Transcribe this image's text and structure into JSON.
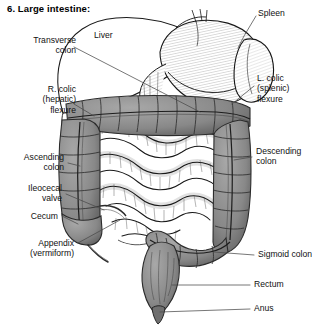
{
  "figure": {
    "title": "6. Large intestine:",
    "domain_note": "anatomical line drawing of abdominal viscera"
  },
  "labels": {
    "transverse_colon": "Transverse\ncolon",
    "liver": "Liver",
    "spleen": "Spleen",
    "r_colic_flexure": "R. colic\n(hepatic)\nflexure",
    "l_colic_flexure": "L. colic\n(splenic)\nflexure",
    "ascending_colon": "Ascending\ncolon",
    "descending_colon": "Descending\ncolon",
    "ileocecal_valve": "Ileocecal\nvalve",
    "cecum": "Cecum",
    "appendix": "Appendix\n(vermiform)",
    "sigmoid_colon": "Sigmoid colon",
    "rectum": "Rectum",
    "anus": "Anus"
  },
  "colors": {
    "ink": "#111111",
    "colon_fill": "#8d8d8d",
    "colon_dark": "#6e6e6e",
    "organ_fill": "#ffffff",
    "leader": "#555555",
    "background": "#ffffff"
  }
}
